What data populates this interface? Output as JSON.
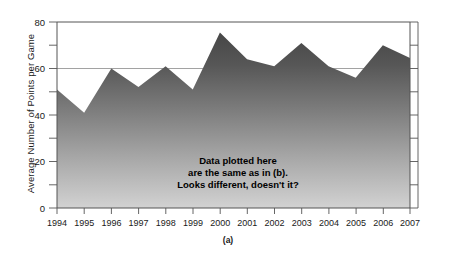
{
  "figure": {
    "caption": "(a)",
    "annotation_lines": [
      "Data plotted here",
      "are the same as in (b).",
      "Looks different, doesn't it?"
    ]
  },
  "chart_data": {
    "type": "area",
    "title": "",
    "xlabel": "",
    "ylabel": "Average Number of Points per Game",
    "categories": [
      "1994",
      "1995",
      "1996",
      "1997",
      "1998",
      "1999",
      "2000",
      "2001",
      "2002",
      "2003",
      "2004",
      "2005",
      "2006",
      "2007"
    ],
    "values": [
      51,
      41,
      60,
      52,
      61,
      51,
      75.5,
      64,
      61,
      71,
      61,
      56,
      70,
      64.5
    ],
    "ylim": [
      0,
      80
    ],
    "ytick_labels": [
      "0",
      "20",
      "40",
      "60",
      "80"
    ],
    "ytick_values": [
      0,
      20,
      40,
      60,
      80
    ],
    "yminor_step": 10,
    "grid": true,
    "legend": "none",
    "fill_top_color": "#474747",
    "fill_bottom_color": "#d2d2d2",
    "axis_color": "#555555",
    "grid_color": "#8a8a8a"
  }
}
